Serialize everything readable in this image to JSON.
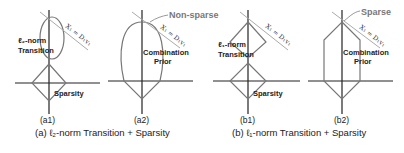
{
  "panels": {
    "a1": {
      "sub_label": "(a1)",
      "region_label_line1": "ℓ₂-norm",
      "region_label_line2": "Transition",
      "sparsity_label": "Sparsity",
      "line_label": "X₁ = D₁v₁"
    },
    "a2": {
      "sub_label": "(a2)",
      "point_label": "Non-sparse",
      "prior_label_line1": "Combination",
      "prior_label_line2": "Prior",
      "line_label": "X₁ = D₁v₁"
    },
    "b1": {
      "sub_label": "(b1)",
      "region_label_line1": "ℓ₁-norm",
      "region_label_line2": "Transition",
      "sparsity_label": "Sparsity",
      "line_label": "X₁ = D₁v₁"
    },
    "b2": {
      "sub_label": "(b2)",
      "point_label": "Sparse",
      "prior_label_line1": "Combination",
      "prior_label_line2": "Prior",
      "line_label": "X₁ = D₁v₁"
    }
  },
  "captions": {
    "a": "(a) ℓ₂-norm Transition + Sparsity",
    "b": "(b) ℓ₁-norm Transition + Sparsity"
  },
  "colors": {
    "axis": "#222222",
    "shape": "#777777",
    "constraint_line": "#aaaaaa",
    "annotation": "#777777"
  }
}
